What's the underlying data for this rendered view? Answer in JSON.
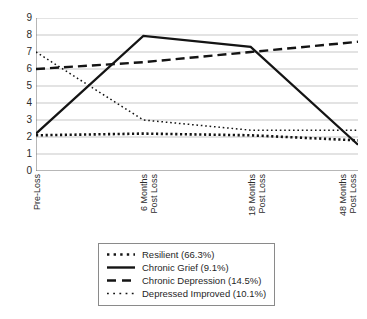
{
  "chart_data": {
    "type": "line",
    "title": "",
    "xlabel": "",
    "ylabel": "",
    "ylim": [
      0,
      9
    ],
    "yticks": [
      "0",
      "1",
      "2",
      "3",
      "4",
      "5",
      "6",
      "7",
      "8",
      "9"
    ],
    "grid": true,
    "legend_position": "bottom-center",
    "categories": [
      "Pre-Loss",
      "6 Months Post Loss",
      "18 Months Post Loss",
      "48 Months Post Loss"
    ],
    "x_tick_lines": [
      [
        "Pre-Loss"
      ],
      [
        "6 Months",
        "Post Loss"
      ],
      [
        "18 Months",
        "Post Loss"
      ],
      [
        "48 Months",
        "Post Loss"
      ]
    ],
    "series": [
      {
        "name": "Resilient (66.3%)",
        "style": "dotted-bold",
        "color": "#141414",
        "values": [
          2.1,
          2.2,
          2.1,
          1.8
        ]
      },
      {
        "name": "Chronic Grief (9.1%)",
        "style": "solid",
        "color": "#141414",
        "values": [
          2.2,
          7.95,
          7.3,
          1.55
        ]
      },
      {
        "name": "Chronic Depression (14.5%)",
        "style": "dashed",
        "color": "#141414",
        "values": [
          6.0,
          6.4,
          7.0,
          7.6
        ]
      },
      {
        "name": "Depressed Improved (10.1%)",
        "style": "dotted-fine",
        "color": "#141414",
        "values": [
          7.0,
          3.0,
          2.4,
          2.4
        ]
      }
    ]
  },
  "legend": {
    "items": [
      {
        "label": "Resilient (66.3%)",
        "swatch": "dotted-bold-swatch"
      },
      {
        "label": "Chronic Grief (9.1%)",
        "swatch": "solid-line-swatch"
      },
      {
        "label": "Chronic Depression (14.5%)",
        "swatch": "dashed-line-swatch"
      },
      {
        "label": "Depressed Improved (10.1%)",
        "swatch": "dotted-fine-swatch"
      }
    ]
  }
}
